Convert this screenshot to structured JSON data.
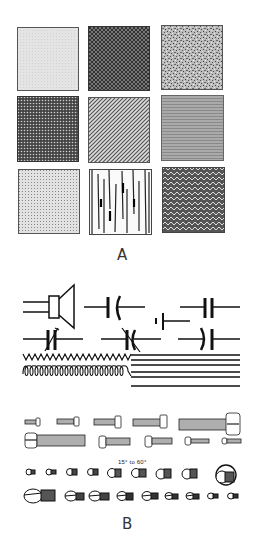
{
  "panel_a": {
    "label": "A",
    "swatches": [
      {
        "name": "light-gray-fine",
        "row": 0,
        "col": 0
      },
      {
        "name": "crosshatch-dark",
        "row": 0,
        "col": 1
      },
      {
        "name": "speckled-noise",
        "row": 0,
        "col": 2
      },
      {
        "name": "dense-dots-dark",
        "row": 1,
        "col": 0
      },
      {
        "name": "diagonal-lines",
        "row": 1,
        "col": 1
      },
      {
        "name": "horizontal-fine-lines",
        "row": 1,
        "col": 2
      },
      {
        "name": "light-stipple",
        "row": 2,
        "col": 0
      },
      {
        "name": "wood-grain",
        "row": 2,
        "col": 1
      },
      {
        "name": "herringbone-zigzag",
        "row": 2,
        "col": 2
      }
    ]
  },
  "panel_b": {
    "label": "B",
    "angle_note": "15° to 60°",
    "symbols": [
      "speaker",
      "capacitor-curved",
      "capacitor-fixed",
      "battery-cell",
      "variable-capacitor",
      "trimmer-capacitor",
      "capacitor-curved-2",
      "resistor-zigzag",
      "inductor-coil",
      "parallel-lines"
    ],
    "screw_rows": [
      {
        "type": "side-view",
        "count": 5
      },
      {
        "type": "side-view",
        "count": 5
      },
      {
        "type": "head-view",
        "count": 9
      },
      {
        "type": "head-view",
        "count": 9
      }
    ]
  }
}
